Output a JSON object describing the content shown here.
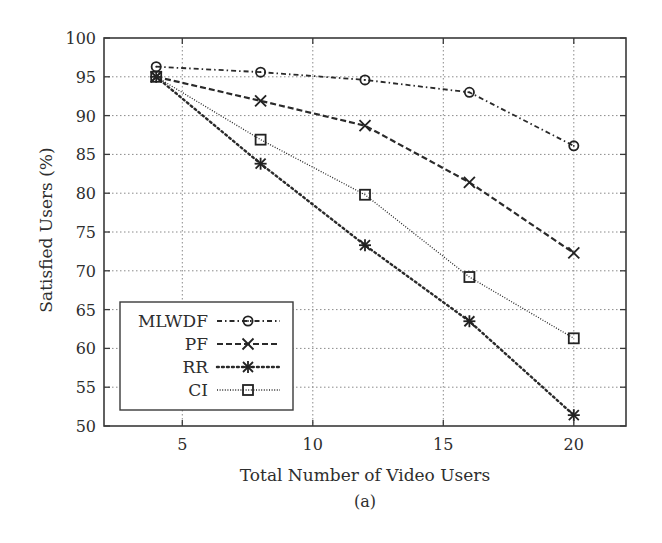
{
  "chart_data": {
    "type": "line",
    "title": "",
    "xlabel": "Total Number of Video Users",
    "ylabel": "Satisfied Users (%)",
    "caption": "(a)",
    "x": [
      4,
      8,
      12,
      16,
      20
    ],
    "xlim": [
      2,
      22
    ],
    "ylim": [
      50,
      100
    ],
    "xticks": [
      5,
      10,
      15,
      20
    ],
    "yticks": [
      50,
      55,
      60,
      65,
      70,
      75,
      80,
      85,
      90,
      95,
      100
    ],
    "grid": true,
    "legend_position": "lower left",
    "series": [
      {
        "name": "MLWDF",
        "values": [
          96.3,
          95.6,
          94.6,
          93.0,
          86.1
        ],
        "line_style": "dash-dot",
        "marker": "circle"
      },
      {
        "name": "PF",
        "values": [
          95.0,
          91.9,
          88.7,
          81.4,
          72.3
        ],
        "line_style": "dashed",
        "marker": "x"
      },
      {
        "name": "RR",
        "values": [
          95.0,
          83.8,
          73.3,
          63.5,
          51.4
        ],
        "line_style": "dotted",
        "marker": "asterisk"
      },
      {
        "name": "CI",
        "values": [
          95.0,
          86.9,
          79.8,
          69.2,
          61.3
        ],
        "line_style": "fine-dotted",
        "marker": "square"
      }
    ]
  },
  "axes": {
    "x_label": "Total Number of Video Users",
    "y_label": "Satisfied Users (%)",
    "caption": "(a)"
  },
  "legend": {
    "items": [
      {
        "label": "MLWDF",
        "marker_icon": "circle-marker-icon"
      },
      {
        "label": "PF",
        "marker_icon": "x-marker-icon"
      },
      {
        "label": "RR",
        "marker_icon": "asterisk-marker-icon"
      },
      {
        "label": "CI",
        "marker_icon": "square-marker-icon"
      }
    ]
  },
  "colors": {
    "ink": "#2a2a2a",
    "grid": "#8a8a8a",
    "background": "#ffffff"
  }
}
